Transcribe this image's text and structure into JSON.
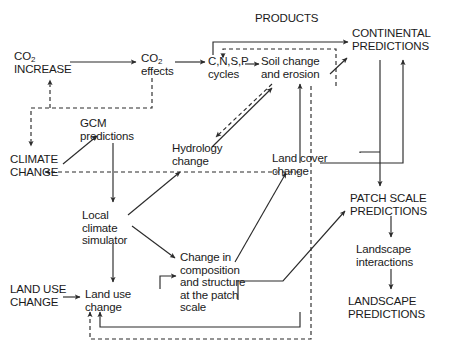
{
  "diagram": {
    "type": "flow-diagram",
    "background_color": "#ffffff",
    "line_color": "#2b2b2b",
    "text_color": "#1a1a1a",
    "nodes": [
      {
        "id": "co2_increase",
        "label": "CO2\nINCREASE",
        "line1": "CO",
        "sub1": "2",
        "line2": "INCREASE",
        "style": "caps",
        "x": 14,
        "y": 50
      },
      {
        "id": "co2_effects",
        "label": "CO2\neffects",
        "line1": "CO",
        "sub1": "2",
        "line2": "effects",
        "style": "lower",
        "x": 141,
        "y": 52
      },
      {
        "id": "cnsp_cycles",
        "label": "C,N,S,P\ncycles",
        "style": "lower",
        "x": 210,
        "y": 55
      },
      {
        "id": "soil_change",
        "label": "Soil change\nand erosion",
        "style": "lower",
        "x": 260,
        "y": 55
      },
      {
        "id": "products",
        "label": "PRODUCTS",
        "style": "caps",
        "x": 255,
        "y": 12
      },
      {
        "id": "continental",
        "label": "CONTINENTAL\nPREDICTIONS",
        "style": "caps",
        "x": 353,
        "y": 27
      },
      {
        "id": "gcm_predictions",
        "label": "GCM\npredictions",
        "style": "lower",
        "x": 80,
        "y": 117
      },
      {
        "id": "climate_change",
        "label": "CLIMATE\nCHANGE",
        "style": "caps",
        "x": 10,
        "y": 153
      },
      {
        "id": "hydrology_change",
        "label": "Hydrology\nchange",
        "style": "lower",
        "x": 172,
        "y": 142
      },
      {
        "id": "land_cover_change",
        "label": "Land cover\nchange",
        "style": "lower",
        "x": 272,
        "y": 152
      },
      {
        "id": "patch_scale",
        "label": "PATCH SCALE\nPREDICTIONS",
        "style": "caps",
        "x": 352,
        "y": 192
      },
      {
        "id": "local_climate_sim",
        "label": "Local\nclimate\nsimulator",
        "style": "lower",
        "x": 82,
        "y": 209
      },
      {
        "id": "landscape_inter",
        "label": "Landscape\ninteractions",
        "style": "lower",
        "x": 356,
        "y": 243
      },
      {
        "id": "patch_change",
        "label": "Change in\ncomposition\nand structure\nat the patch\nscale",
        "style": "lower",
        "x": 180,
        "y": 251
      },
      {
        "id": "land_use_change_in",
        "label": "LAND USE\nCHANGE",
        "style": "caps",
        "x": 10,
        "y": 283
      },
      {
        "id": "land_use_change",
        "label": "Land use\nchange",
        "style": "lower",
        "x": 85,
        "y": 288
      },
      {
        "id": "landscape_pred",
        "label": "LANDSCAPE\nPREDICTIONS",
        "style": "caps",
        "x": 350,
        "y": 295
      }
    ],
    "edges": [
      {
        "from": "co2_increase",
        "to": "co2_effects",
        "style": "solid"
      },
      {
        "from": "co2_effects",
        "to": "cnsp_cycles",
        "style": "solid"
      },
      {
        "from": "cnsp_cycles",
        "to": "soil_change",
        "style": "solid"
      },
      {
        "from": "cnsp_cycles",
        "to": "continental",
        "style": "solid"
      },
      {
        "from": "soil_change",
        "to": "continental",
        "style": "solid"
      },
      {
        "from": "land_cover_change",
        "to": "cnsp_cycles",
        "style": "dashed"
      },
      {
        "from": "co2_effects",
        "to": "climate_change",
        "style": "dashed"
      },
      {
        "from": "co2_effects",
        "to": "co2_increase",
        "style": "dashed"
      },
      {
        "from": "climate_change",
        "to": "gcm_predictions",
        "style": "solid"
      },
      {
        "from": "gcm_predictions",
        "to": "local_climate_sim",
        "style": "solid"
      },
      {
        "from": "land_cover_change",
        "to": "climate_change",
        "style": "dashed"
      },
      {
        "from": "soil_change",
        "to": "hydrology_change",
        "style": "dashed"
      },
      {
        "from": "hydrology_change",
        "to": "soil_change",
        "style": "solid"
      },
      {
        "from": "local_climate_sim",
        "to": "hydrology_change",
        "style": "solid"
      },
      {
        "from": "local_climate_sim",
        "to": "patch_change",
        "style": "solid"
      },
      {
        "from": "local_climate_sim",
        "to": "land_use_change",
        "style": "solid"
      },
      {
        "from": "land_use_change_in",
        "to": "land_use_change",
        "style": "solid"
      },
      {
        "from": "land_use_change",
        "to": "patch_change",
        "style": "solid"
      },
      {
        "from": "patch_change",
        "to": "land_cover_change",
        "style": "solid"
      },
      {
        "from": "land_cover_change",
        "to": "soil_change",
        "style": "solid"
      },
      {
        "from": "land_cover_change",
        "to": "continental",
        "style": "solid"
      },
      {
        "from": "land_cover_change",
        "to": "patch_scale",
        "style": "solid"
      },
      {
        "from": "patch_change",
        "to": "patch_scale",
        "style": "solid"
      },
      {
        "from": "patch_scale",
        "to": "landscape_inter",
        "style": "solid"
      },
      {
        "from": "landscape_inter",
        "to": "landscape_pred",
        "style": "solid"
      },
      {
        "from": "patch_scale",
        "to": "land_use_change",
        "style": "dashed"
      },
      {
        "from": "patch_change",
        "to": "land_use_change",
        "style": "solid"
      }
    ]
  }
}
